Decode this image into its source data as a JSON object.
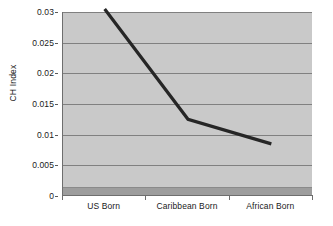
{
  "chart_data": {
    "type": "line",
    "title": "",
    "xlabel": "",
    "ylabel": "CH Index",
    "categories": [
      "US Born",
      "Caribbean Born",
      "African Born"
    ],
    "values": [
      0.0305,
      0.0125,
      0.0085
    ],
    "series": [
      {
        "name": "CH Index",
        "values": [
          0.0305,
          0.0125,
          0.0085
        ]
      }
    ],
    "ylim": [
      0,
      0.03
    ],
    "yticks": [
      "0",
      "0.005",
      "0.01",
      "0.015",
      "0.02",
      "0.025",
      "0.03"
    ],
    "ytick_values": [
      0,
      0.005,
      0.01,
      0.015,
      0.02,
      0.025,
      0.03
    ],
    "grid": "horizontal",
    "legend": "none",
    "colors": {
      "plot_background": "#c9c9c9",
      "page_background": "#ffffff",
      "gridline": "#808080",
      "series_line": "#262626",
      "axis": "#6e6e6e",
      "floor_band": "#9d9d9d",
      "text": "#1a1a1a"
    }
  }
}
